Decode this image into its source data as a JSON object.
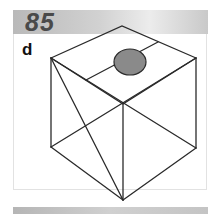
{
  "header": {
    "number": "85"
  },
  "option_label": "d",
  "colors": {
    "circle_fill": "#8a8a8a",
    "line": "#2a2a2a"
  },
  "figure": {
    "type": "cube-net-isometric",
    "shape": "cube with diagonals and a grey circle on top face"
  }
}
